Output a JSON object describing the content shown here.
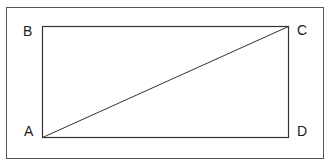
{
  "diagram": {
    "type": "geometry",
    "vertices": [
      {
        "name": "A",
        "position": "bottom-left"
      },
      {
        "name": "B",
        "position": "top-left"
      },
      {
        "name": "C",
        "position": "top-right"
      },
      {
        "name": "D",
        "position": "bottom-right"
      }
    ],
    "segments": [
      "AB",
      "BC",
      "CD",
      "DA",
      "AC"
    ],
    "labels": {
      "a": "A",
      "b": "B",
      "c": "C",
      "d": "D"
    },
    "colors": {
      "stroke": "#333333",
      "text": "#1a1a1a",
      "background": "#ffffff"
    }
  }
}
